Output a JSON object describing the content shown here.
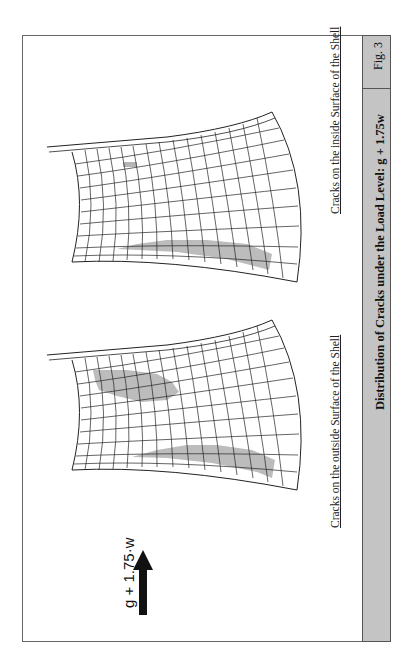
{
  "figure": {
    "number_label": "Fig. 3",
    "title": "Distribution of Cracks under the Load Level: g + 1.75w",
    "load_indicator": {
      "label": "g + 1.75·w",
      "arrow_icon": "arrow-up-icon"
    },
    "panels": [
      {
        "caption": "Cracks on the outside Surface of the Shell",
        "crack_regions": [
          "upper-middle patch",
          "lower edge band"
        ]
      },
      {
        "caption": "Cracks on the inside Surface of the Shell",
        "crack_regions": [
          "small upper patch",
          "lower edge band"
        ]
      }
    ],
    "colors": {
      "band": "#c4c4c4",
      "crack_fill": "#b5b5b5",
      "mesh_line": "#222222",
      "frame": "#666666"
    }
  }
}
